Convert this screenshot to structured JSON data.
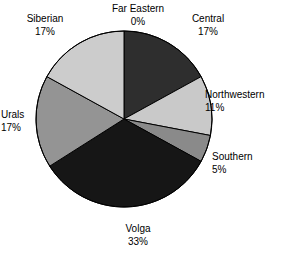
{
  "chart_data": {
    "type": "pie",
    "title": "",
    "categories": [
      "Far Eastern",
      "Central",
      "Northwestern",
      "Southern",
      "Volga",
      "Urals",
      "Siberian"
    ],
    "values": [
      0,
      17,
      11,
      5,
      33,
      17,
      17
    ],
    "value_unit": "%",
    "start_angle_deg": 0,
    "direction": "clockwise",
    "legend": "none",
    "labels_position": "outside",
    "slices": [
      {
        "label": "Far Eastern",
        "value": 0,
        "value_text": "0%",
        "color": "#ffffff"
      },
      {
        "label": "Central",
        "value": 17,
        "value_text": "17%",
        "color": "#2e2e2e"
      },
      {
        "label": "Northwestern",
        "value": 11,
        "value_text": "11%",
        "color": "#c9c9c9"
      },
      {
        "label": "Southern",
        "value": 5,
        "value_text": "5%",
        "color": "#8a8a8a"
      },
      {
        "label": "Volga",
        "value": 33,
        "value_text": "33%",
        "color": "#161616"
      },
      {
        "label": "Urals",
        "value": 17,
        "value_text": "17%",
        "color": "#949494"
      },
      {
        "label": "Siberian",
        "value": 17,
        "value_text": "17%",
        "color": "#cccccc"
      }
    ]
  },
  "labels": {
    "far_eastern": {
      "name": "Far Eastern",
      "pct": "0%"
    },
    "siberian": {
      "name": "Siberian",
      "pct": "17%"
    },
    "central": {
      "name": "Central",
      "pct": "17%"
    },
    "northwestern": {
      "name": "Northwestern",
      "pct": "11%"
    },
    "southern": {
      "name": "Southern",
      "pct": "5%"
    },
    "urals": {
      "name": "Urals",
      "pct": "17%"
    },
    "volga": {
      "name": "Volga",
      "pct": "33%"
    }
  },
  "style": {
    "background": "#ffffff",
    "outline": "#000000",
    "text_color": "#000000"
  }
}
